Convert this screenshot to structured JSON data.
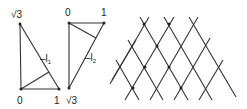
{
  "triangle1": {
    "top_label": "√3",
    "bottom_left_label": "0",
    "bottom_right_label": "1",
    "line_label": "l",
    "line_subscript": "1"
  },
  "triangle2": {
    "top_left_label": "0",
    "top_right_label": "1",
    "bottom_label": "√3",
    "line_label": "l",
    "line_subscript": "2"
  },
  "lattice": {
    "description": "triangular lattice of crossing diagonal lines with marked points",
    "line_color": "#333333"
  }
}
